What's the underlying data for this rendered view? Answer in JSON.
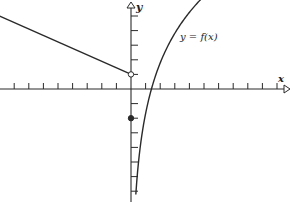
{
  "diagram": {
    "curve_label": "y = f(x)",
    "x_axis_label": "x",
    "y_axis_label": "y",
    "colors": {
      "ink": "#2a2a2a",
      "background": "#ffffff"
    }
  },
  "chart_data": {
    "type": "line",
    "title": "",
    "xlabel": "x",
    "ylabel": "y",
    "xlim": [
      -9,
      10.5
    ],
    "ylim": [
      -7.8,
      6.1
    ],
    "grid": false,
    "series": [
      {
        "name": "left branch (line)",
        "x": [
          -9,
          0
        ],
        "y": [
          5,
          1
        ],
        "end_marker": "open-circle at (0, 1)"
      },
      {
        "name": "y = f(x) (log curve)",
        "formula": "5*ln(x/1.4)",
        "x_domain": [
          0.33,
          5.0
        ]
      }
    ],
    "points": [
      {
        "name": "open-circle",
        "x": 0,
        "y": 1,
        "filled": false
      },
      {
        "name": "filled-dot",
        "x": 0,
        "y": -2,
        "filled": true
      }
    ],
    "ticks": {
      "x": [
        -8,
        -7,
        -6,
        -5,
        -4,
        -3,
        -2,
        -1,
        1,
        2,
        3,
        4,
        5,
        6,
        7,
        8,
        9,
        10
      ],
      "y": [
        -7,
        -6,
        -5,
        -4,
        -3,
        -2,
        -1,
        1,
        2,
        3,
        4,
        5
      ]
    },
    "annotations": [
      "y = f(x)"
    ]
  }
}
